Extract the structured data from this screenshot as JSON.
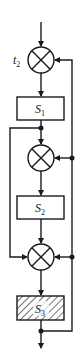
{
  "diagram": {
    "type": "block-diagram",
    "input_label": "t",
    "input_label_sub": "2",
    "blocks": [
      {
        "id": "S1",
        "label": "S",
        "sub": "1",
        "hatched": false
      },
      {
        "id": "S2",
        "label": "S",
        "sub": "2",
        "hatched": false
      },
      {
        "id": "S3",
        "label": "S",
        "sub": "3",
        "hatched": true
      }
    ],
    "summing_junctions": [
      {
        "id": "sum1",
        "symbol": "multiply-cross"
      },
      {
        "id": "sum2",
        "symbol": "multiply-cross"
      },
      {
        "id": "sum3",
        "symbol": "multiply-cross"
      }
    ],
    "connections": [
      "input -> sum1",
      "sum1 -> S1",
      "S1 -> sum2",
      "S1 -> sum3 (left bypass)",
      "sum2 -> S2",
      "S2 -> sum3",
      "sum3 -> S3",
      "S3 -> output",
      "S3 output -> feedback to sum1, sum2, sum3 (right rail)"
    ],
    "colors": {
      "line": "#1a1a1a",
      "background": "#ffffff"
    }
  }
}
